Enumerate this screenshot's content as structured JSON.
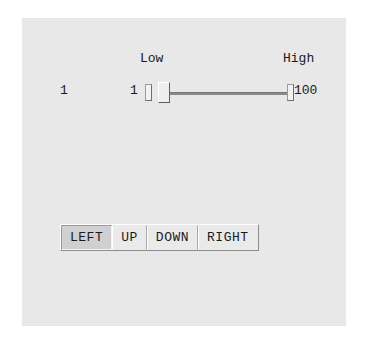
{
  "panel": {
    "background_color": "#e8e8e8",
    "page_background_color": "#ffffff"
  },
  "scale": {
    "outer_value": "1",
    "low_caption": "Low",
    "high_caption": "High",
    "min_value": "1",
    "max_value": "100",
    "current_value": 1,
    "range_min": 1,
    "range_max": 100,
    "track_color": "#8a8a8a",
    "thumb_color": "#eeeeee"
  },
  "button_bar": {
    "selected": "LEFT",
    "buttons": [
      {
        "label": "LEFT",
        "selected": true
      },
      {
        "label": "UP",
        "selected": false
      },
      {
        "label": "DOWN",
        "selected": false
      },
      {
        "label": "RIGHT",
        "selected": false
      }
    ]
  }
}
